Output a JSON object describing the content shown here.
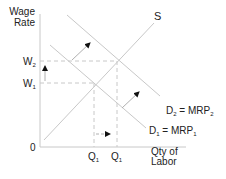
{
  "diagram": {
    "type": "labor-market-supply-demand",
    "y_axis_label_line1": "Wage",
    "y_axis_label_line2": "Rate",
    "x_axis_label_line1": "Qty of",
    "x_axis_label_line2": "Labor",
    "origin_label": "0",
    "supply_label": "S",
    "demand1_label": {
      "main": "D",
      "sub": "1",
      "eq": " = MRP",
      "eq_sub": "1"
    },
    "demand2_label": {
      "main": "D",
      "sub": "2",
      "eq": " = MRP",
      "eq_sub": "2"
    },
    "w1_label": {
      "main": "W",
      "sub": "1"
    },
    "w2_label": {
      "main": "W",
      "sub": "2"
    },
    "q1_label": {
      "main": "Q",
      "sub": "1"
    },
    "q2_label": {
      "main": "Q",
      "sub": "1"
    },
    "colors": {
      "curve": "#c8c8c8",
      "axis": "#c8c8c8",
      "dash": "#c8c8c8",
      "text": "#222222",
      "arrow": "#111111"
    }
  }
}
